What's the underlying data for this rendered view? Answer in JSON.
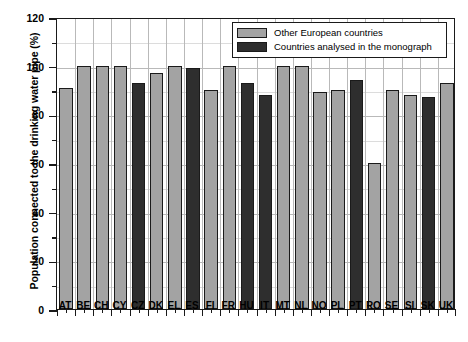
{
  "chart_data": {
    "type": "bar",
    "title": "",
    "xlabel": "",
    "ylabel": "Population connected to the drinking water pipe (%)",
    "ylim": [
      0,
      120
    ],
    "ytick_step": 20,
    "yminor_step": 10,
    "grid": true,
    "legend_position": "top-right-inside",
    "categories": [
      "AT",
      "BE",
      "CH",
      "CY",
      "CZ",
      "DK",
      "EL",
      "ES",
      "FI",
      "FR",
      "HU",
      "IT",
      "MT",
      "NL",
      "NO",
      "PL",
      "PT",
      "RO",
      "SE",
      "SI",
      "SK",
      "UK"
    ],
    "values": [
      91,
      100,
      100,
      100,
      93,
      97,
      100,
      99,
      90,
      100,
      93,
      88,
      100,
      100,
      89,
      90,
      94,
      60,
      90,
      88,
      87,
      93
    ],
    "groups": [
      "other",
      "other",
      "other",
      "other",
      "mono",
      "other",
      "other",
      "mono",
      "other",
      "other",
      "mono",
      "mono",
      "other",
      "other",
      "other",
      "other",
      "mono",
      "other",
      "other",
      "other",
      "mono",
      "other"
    ],
    "series": [
      {
        "name": "Other European countries",
        "key": "other",
        "color": "#a3a3a3",
        "points": [
          {
            "category": "AT",
            "value": 91
          },
          {
            "category": "BE",
            "value": 100
          },
          {
            "category": "CH",
            "value": 100
          },
          {
            "category": "CY",
            "value": 100
          },
          {
            "category": "DK",
            "value": 97
          },
          {
            "category": "EL",
            "value": 100
          },
          {
            "category": "FI",
            "value": 90
          },
          {
            "category": "FR",
            "value": 100
          },
          {
            "category": "MT",
            "value": 100
          },
          {
            "category": "NL",
            "value": 100
          },
          {
            "category": "NO",
            "value": 89
          },
          {
            "category": "PL",
            "value": 90
          },
          {
            "category": "RO",
            "value": 60
          },
          {
            "category": "SE",
            "value": 90
          },
          {
            "category": "SI",
            "value": 88
          },
          {
            "category": "UK",
            "value": 93
          }
        ]
      },
      {
        "name": "Countries analysed in the monograph",
        "key": "mono",
        "color": "#2e2e2e",
        "points": [
          {
            "category": "CZ",
            "value": 93
          },
          {
            "category": "ES",
            "value": 99
          },
          {
            "category": "HU",
            "value": 93
          },
          {
            "category": "IT",
            "value": 88
          },
          {
            "category": "PT",
            "value": 94
          },
          {
            "category": "SK",
            "value": 87
          }
        ]
      }
    ],
    "ytick_labels": [
      "0",
      "20",
      "40",
      "60",
      "80",
      "100",
      "120"
    ]
  },
  "legend": {
    "items": [
      {
        "label": "Other European countries",
        "key": "other"
      },
      {
        "label": "Countries analysed in the monograph",
        "key": "mono"
      }
    ]
  },
  "colors": {
    "other": "#a3a3a3",
    "mono": "#2e2e2e",
    "axis": "#1a1a1a",
    "grid": "#b9b9b9",
    "background": "#ffffff"
  }
}
